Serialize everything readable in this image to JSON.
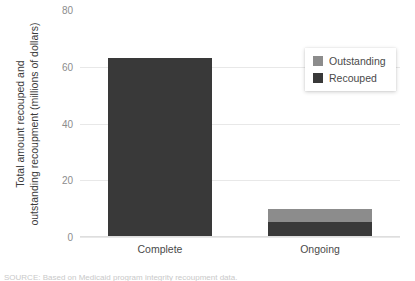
{
  "chart_data": {
    "type": "bar",
    "title": "",
    "subtitle": "",
    "xlabel": "",
    "ylabel": "Total amount recouped and outstanding recoupment (millions of dollars)",
    "ylabel_lines": [
      "Total amount recouped and",
      "outstanding recoupment (millions of dollars)"
    ],
    "categories": [
      "Complete",
      "Ongoing"
    ],
    "stacked": true,
    "series": [
      {
        "name": "Recouped",
        "color": "#393939",
        "values": [
          62.8,
          4.9
        ]
      },
      {
        "name": "Outstanding",
        "color": "#8c8c8c",
        "values": [
          0,
          4.8
        ]
      }
    ],
    "ylim": [
      0,
      80
    ],
    "yticks": [
      0,
      20,
      40,
      60,
      80
    ],
    "ytick_labels": [
      "0",
      "20",
      "40",
      "60",
      "80"
    ],
    "grid": true,
    "grid_axis": "y",
    "legend_position": "top-right",
    "legend_entries": [
      {
        "label": "Outstanding",
        "color": "#8c8c8c"
      },
      {
        "label": "Recouped",
        "color": "#393939"
      }
    ]
  },
  "footnote": {
    "text": "SOURCE: Based on Medicaid program integrity recoupment data."
  }
}
